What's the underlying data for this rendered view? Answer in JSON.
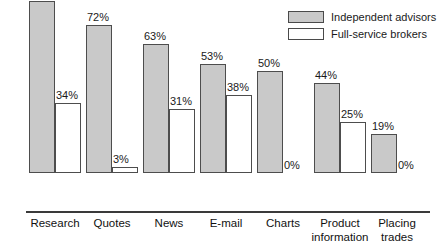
{
  "chart_data": {
    "type": "bar",
    "title": "",
    "subtitle": "",
    "xlabel": "",
    "ylabel": "",
    "ylim": [
      0,
      100
    ],
    "grid": false,
    "legend_position": "top-right",
    "value_suffix": "%",
    "categories": [
      "Research",
      "Quotes",
      "News",
      "E-mail",
      "Charts",
      "Product\ninformation",
      "Placing\ntrades"
    ],
    "series": [
      {
        "name": "Independent advisors",
        "color": "#c9c9c9",
        "values": [
          91,
          72,
          63,
          53,
          50,
          44,
          19
        ],
        "labels": [
          "91%",
          "72%",
          "63%",
          "53%",
          "50%",
          "44%",
          "19%"
        ]
      },
      {
        "name": "Full-service brokers",
        "color": "#ffffff",
        "values": [
          34,
          3,
          31,
          38,
          0,
          25,
          0
        ],
        "labels": [
          "34%",
          "3%",
          "31%",
          "38%",
          "0%",
          "25%",
          "0%"
        ]
      }
    ]
  },
  "legend": {
    "items": [
      {
        "label": "Independent advisors",
        "swatch": "gray"
      },
      {
        "label": "Full-service brokers",
        "swatch": "white"
      }
    ]
  },
  "colors": {
    "series_gray": "#c9c9c9",
    "series_white": "#ffffff",
    "outline": "#4d4d4d",
    "axis": "#3a3a3a",
    "text": "#1a1a1a"
  }
}
